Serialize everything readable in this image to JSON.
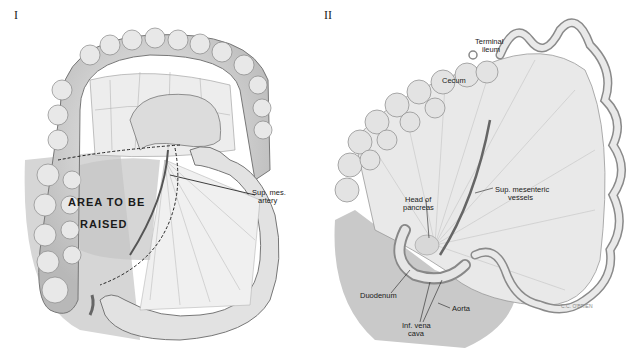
{
  "panels": [
    {
      "numeral": "I",
      "labels": {
        "area_line1": "AREA TO BE",
        "area_line2": "RAISED",
        "artery_line1": "Sup. mes.",
        "artery_line2": "artery"
      }
    },
    {
      "numeral": "II",
      "labels": {
        "terminal_line1": "Terminal",
        "terminal_line2": "ileum",
        "cecum": "Cecum",
        "pancreas_line1": "Head of",
        "pancreas_line2": "pancreas",
        "vessels_line1": "Sup. mesenteric",
        "vessels_line2": "vessels",
        "duodenum": "Duodenum",
        "aorta": "Aorta",
        "ivc_line1": "Inf. vena",
        "ivc_line2": "cava",
        "signature": "C.C. O'BRIEN"
      }
    }
  ],
  "colors": {
    "background": "#ffffff",
    "tissue_light": "#e6e6e6",
    "tissue_mid": "#c8c8c8",
    "tissue_dark": "#8a8a8a",
    "ink": "#1a1a1a"
  }
}
